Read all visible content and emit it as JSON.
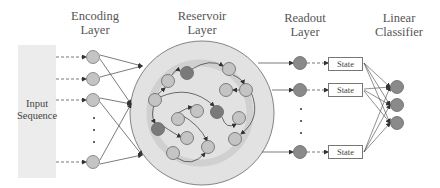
{
  "headers": {
    "encoding": [
      "Encoding",
      "Layer"
    ],
    "reservoir": [
      "Reservoir",
      "Layer"
    ],
    "readout": [
      "Readout",
      "Layer"
    ],
    "classifier": [
      "Linear",
      "Classifier"
    ]
  },
  "input": {
    "label_line1": "Input",
    "label_line2": "Sequence"
  },
  "states": {
    "s1": "State",
    "s2": "State",
    "s3": "State"
  },
  "colors": {
    "light_node": "#c4c4c4",
    "dark_node": "#7a7a7a",
    "readout_node": "#8a8a8a",
    "reservoir_fill": "#e2e2e2",
    "reservoir_ring": "#d2d2d2",
    "input_box": "#ececec"
  }
}
